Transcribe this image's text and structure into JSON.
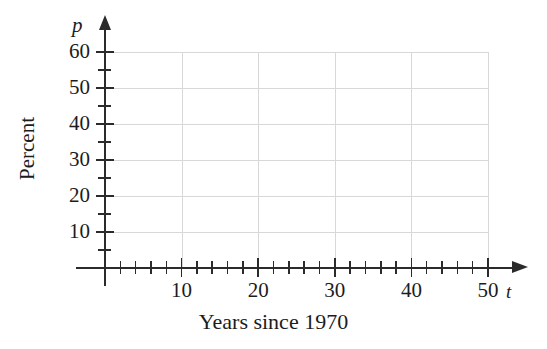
{
  "chart_data": {
    "type": "scatter",
    "title": "",
    "subtitle": "",
    "xlabel": "Years since 1970",
    "ylabel": "Percent",
    "x_axis_variable": "t",
    "y_axis_variable": "p",
    "xlim": [
      0,
      50
    ],
    "ylim": [
      0,
      60
    ],
    "x_ticks_major": [
      10,
      20,
      30,
      40,
      50
    ],
    "x_ticks_major_labels": [
      "10",
      "20",
      "30",
      "40",
      "50"
    ],
    "x_ticks_minor": [
      2,
      4,
      6,
      8,
      12,
      14,
      16,
      18,
      22,
      24,
      26,
      28,
      32,
      34,
      36,
      38,
      42,
      44,
      46,
      48
    ],
    "x_tick_step_minor": 2,
    "y_ticks_major": [
      10,
      20,
      30,
      40,
      50,
      60
    ],
    "y_ticks_major_labels": [
      "10",
      "20",
      "30",
      "40",
      "50",
      "60"
    ],
    "y_ticks_minor": [
      5,
      15,
      25,
      35,
      45,
      55
    ],
    "y_tick_step_minor": 5,
    "grid": true,
    "grid_color": "#d8d8d8",
    "grid_x_values": [
      10,
      20,
      30,
      40,
      50
    ],
    "grid_y_values": [
      10,
      20,
      30,
      40,
      50,
      60
    ],
    "axis_color": "#2b2b2b",
    "background_color": "#ffffff",
    "legend": [],
    "annotations": [],
    "series": [],
    "values": [],
    "categories": [],
    "note": "Empty coordinate grid — blank axes provided for plotting data; no data points, curves or bars are drawn."
  },
  "figure": {
    "axis_variable_p": "p",
    "axis_variable_t": "t",
    "y_axis_title": "Percent",
    "x_axis_title": "Years since 1970"
  }
}
